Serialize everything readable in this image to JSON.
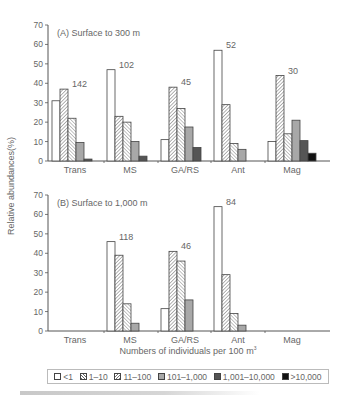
{
  "chart_data": [
    {
      "type": "bar",
      "title": "(A) Surface to 300 m",
      "categories": [
        "Trans",
        "MS",
        "GA/RS",
        "Ant",
        "Mag"
      ],
      "category_annotations": [
        "142",
        "102",
        "45",
        "52",
        "30"
      ],
      "series": [
        {
          "name": "<1",
          "values": [
            31,
            47,
            11,
            57,
            10
          ]
        },
        {
          "name": "1-10",
          "values": [
            37,
            23,
            38,
            29,
            44
          ]
        },
        {
          "name": "11-100",
          "values": [
            22,
            20,
            27,
            9,
            14
          ]
        },
        {
          "name": "101-1,000",
          "values": [
            9.5,
            10,
            17.5,
            6,
            21
          ]
        },
        {
          "name": "1,001-10,000",
          "values": [
            1,
            2.5,
            7,
            null,
            10.5
          ]
        },
        {
          "name": ">10,000",
          "values": [
            null,
            null,
            null,
            null,
            4
          ]
        }
      ],
      "xlabel": "",
      "ylabel": "Relative abundances(%)",
      "ylim": [
        0,
        70
      ],
      "yticks": [
        0,
        10,
        20,
        30,
        40,
        50,
        60,
        70
      ],
      "grid": false
    },
    {
      "type": "bar",
      "title": "(B) Surface to 1,000 m",
      "categories": [
        "Trans",
        "MS",
        "GA/RS",
        "Ant",
        "Mag"
      ],
      "category_annotations": [
        "",
        "118",
        "46",
        "84",
        ""
      ],
      "series": [
        {
          "name": "<1",
          "values": [
            null,
            46,
            11.5,
            64,
            null
          ]
        },
        {
          "name": "1-10",
          "values": [
            null,
            39,
            41,
            29,
            null
          ]
        },
        {
          "name": "11-100",
          "values": [
            null,
            14,
            36,
            9,
            null
          ]
        },
        {
          "name": "101-1,000",
          "values": [
            null,
            4,
            16,
            3,
            null
          ]
        },
        {
          "name": "1,001-10,000",
          "values": [
            null,
            null,
            null,
            null,
            null
          ]
        },
        {
          "name": ">10,000",
          "values": [
            null,
            null,
            null,
            null,
            null
          ]
        }
      ],
      "xlabel": "Numbers of individuals per 100 m³",
      "ylabel": "Relative abundances(%)",
      "ylim": [
        0,
        70
      ],
      "yticks": [
        0,
        10,
        20,
        30,
        40,
        50,
        60,
        70
      ],
      "grid": false
    }
  ],
  "labels": {
    "ylabel": "Relative abundances(%)",
    "xlabel_main": "Numbers of individuals per 100 m",
    "xlabel_sup": "3",
    "panel_a_title": "(A) Surface to 300 m",
    "panel_b_title": "(B) Surface to 1,000 m"
  },
  "legend": {
    "position": "bottom",
    "items": [
      {
        "label": "<1",
        "pattern": "white"
      },
      {
        "label": "1–10",
        "pattern": "dense-hatch"
      },
      {
        "label": "11–100",
        "pattern": "hatch"
      },
      {
        "label": "101–1,000",
        "pattern": "light-gray"
      },
      {
        "label": "1,001–10,000",
        "pattern": "dark-gray"
      },
      {
        "label": ">10,000",
        "pattern": "black"
      }
    ]
  },
  "colors": {
    "axis": "#555555",
    "bar_stroke": "#444444",
    "light_gray": "#a8a8a8",
    "dark_gray": "#555555",
    "black": "#111111"
  }
}
